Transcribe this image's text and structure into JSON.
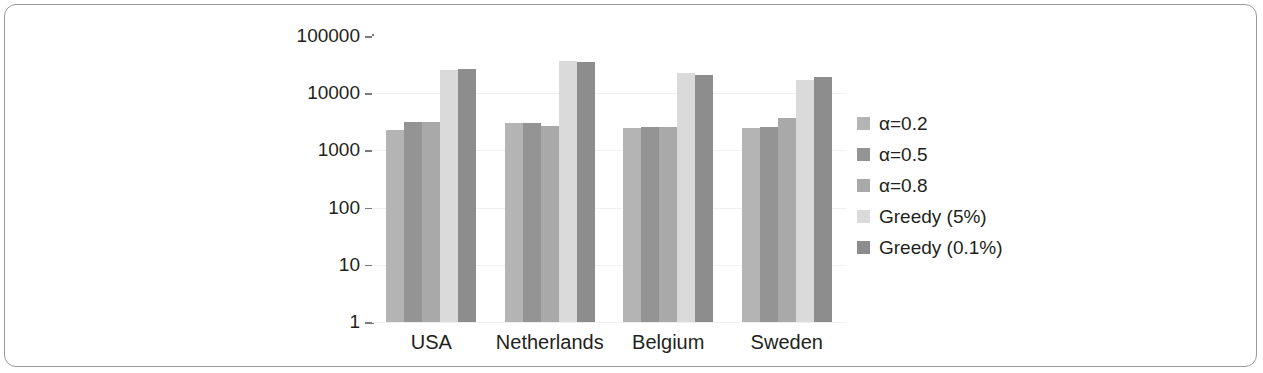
{
  "chart_data": {
    "type": "bar",
    "title": "",
    "xlabel": "",
    "ylabel": "Time (s)",
    "categories": [
      "USA",
      "Netherlands",
      "Belgium",
      "Sweden"
    ],
    "yscale": "log",
    "ylim": [
      1,
      100000
    ],
    "ytick_labels": [
      "100000",
      "10000",
      "1000",
      "100",
      "10",
      "1"
    ],
    "ytick_values": [
      100000,
      10000,
      1000,
      100,
      10,
      1
    ],
    "grid": true,
    "legend_position": "right",
    "series": [
      {
        "name": "α=0.2",
        "color": "#b4b4b4",
        "values": [
          2300,
          3000,
          2450,
          2500
        ]
      },
      {
        "name": "α=0.5",
        "color": "#949494",
        "values": [
          3150,
          3050,
          2550,
          2600
        ]
      },
      {
        "name": "α=0.8",
        "color": "#a9a9a9",
        "values": [
          3150,
          2700,
          2550,
          3700
        ]
      },
      {
        "name": "Greedy (5%)",
        "color": "#dadada",
        "values": [
          25500,
          36000,
          22500,
          17000
        ]
      },
      {
        "name": "Greedy (0.1%)",
        "color": "#8d8d8d",
        "values": [
          26500,
          35000,
          21000,
          19000
        ]
      }
    ]
  },
  "axis": {
    "ylabel": "Time (s)",
    "ticks": [
      "100000",
      "10000",
      "1000",
      "100",
      "10",
      "1"
    ],
    "categories": [
      "USA",
      "Netherlands",
      "Belgium",
      "Sweden"
    ]
  },
  "legend": {
    "items": [
      {
        "label": "α=0.2",
        "color": "#b4b4b4"
      },
      {
        "label": "α=0.5",
        "color": "#949494"
      },
      {
        "label": "α=0.8",
        "color": "#a9a9a9"
      },
      {
        "label": "Greedy (5%)",
        "color": "#dadada"
      },
      {
        "label": "Greedy (0.1%)",
        "color": "#8d8d8d"
      }
    ]
  },
  "figure": {
    "border_color": "#9a9a9a",
    "background": "#ffffff"
  }
}
